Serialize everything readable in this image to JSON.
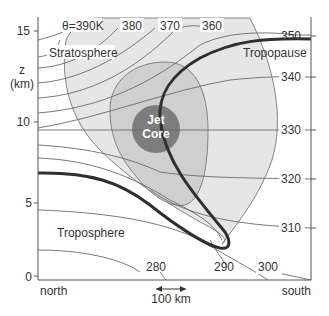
{
  "figure": {
    "type": "cross-section diagram",
    "y_axis": {
      "label_line1": "z",
      "label_line2": "(km)",
      "ticks": [
        "15",
        "10",
        "5",
        "0"
      ]
    },
    "x_axis": {
      "left_label": "north",
      "right_label": "south",
      "scale_bar": "100 km"
    },
    "regions": {
      "stratosphere": "Stratosphere",
      "troposphere": "Troposphere",
      "tropopause": "Tropopause",
      "jet_core_line1": "Jet",
      "jet_core_line2": "Core"
    },
    "isentropes": {
      "top_labels": [
        "θ=390K",
        "380",
        "370",
        "360"
      ],
      "right_labels": [
        "350",
        "340",
        "330",
        "320",
        "310"
      ],
      "bottom_labels": [
        "280",
        "290",
        "300"
      ]
    },
    "colors": {
      "outer_shade": "#e6e6e6",
      "middle_shade": "#cfcfcf",
      "jet_core": "#7d7d7d",
      "tropopause": "#2f2f2f",
      "isentrope": "#6a6a6a"
    }
  }
}
